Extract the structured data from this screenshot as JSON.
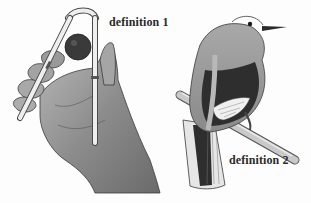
{
  "figure": {
    "type": "illustration",
    "subjects": [
      {
        "id": "hand-with-tongs",
        "label": "definition 1",
        "icon": "hand-holding-tongs-icon"
      },
      {
        "id": "bird-on-branch",
        "label": "definition 2",
        "icon": "bird-icon"
      }
    ]
  },
  "labels": {
    "definition_1": "definition 1",
    "definition_2": "definition 2"
  },
  "colors": {
    "background": "#fdfdfd",
    "ink": "#2a2a2a",
    "skin_shade": "#8a8a8a",
    "bird_body": "#9c9c9c",
    "bird_wing": "#2e2e2e"
  }
}
